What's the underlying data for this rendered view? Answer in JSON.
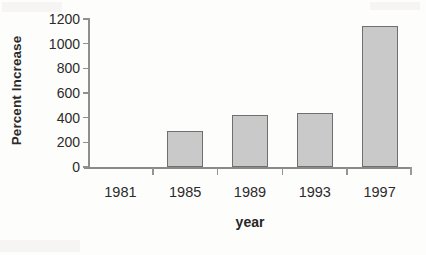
{
  "chart_data": {
    "type": "bar",
    "title": "",
    "xlabel": "year",
    "ylabel": "Percent Increase",
    "categories": [
      "1981",
      "1985",
      "1989",
      "1993",
      "1997"
    ],
    "values": [
      0,
      290,
      420,
      440,
      1140
    ],
    "ylim": [
      0,
      1200
    ],
    "yticks": [
      0,
      200,
      400,
      600,
      800,
      1000,
      1200
    ],
    "ytick_labels": [
      "0",
      "200",
      "400",
      "600",
      "800",
      "1000",
      "1200"
    ],
    "grid": false,
    "legend": null,
    "legend_position": "none",
    "series": [
      {
        "name": "Percent Increase",
        "values": [
          0,
          290,
          420,
          440,
          1140
        ]
      }
    ],
    "bar_fill_color": "#c9c9c9",
    "bar_border_color": "#6f6f6f",
    "axis_color": "#8e8e8e",
    "text_color": "#2b2b2b"
  },
  "axis_titles": {
    "y": "Percent Increase",
    "x": "year"
  }
}
